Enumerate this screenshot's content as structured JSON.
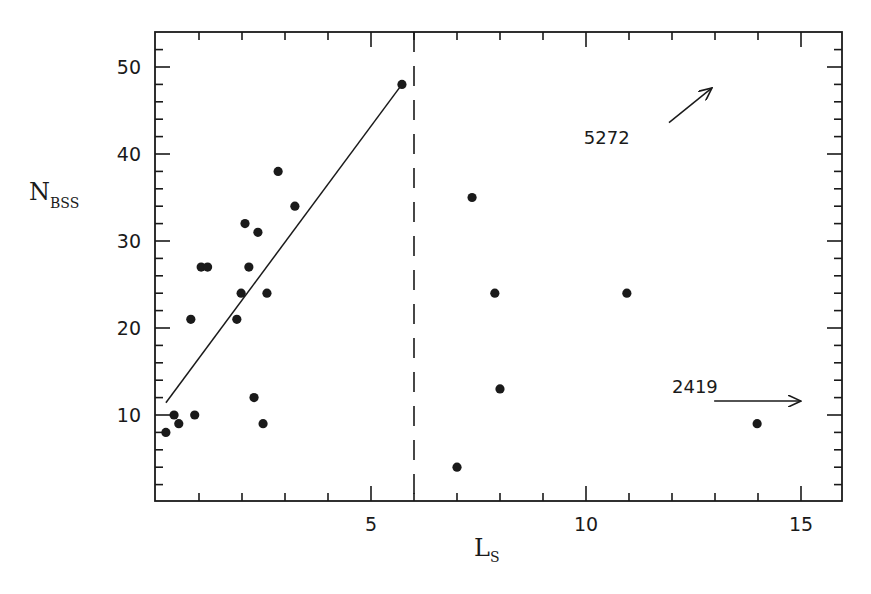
{
  "chart_data": {
    "type": "scatter",
    "title": "",
    "xlabel": "L",
    "xlabel_subscript": "S",
    "ylabel": "N",
    "ylabel_subscript": "BSS",
    "xlim": [
      0,
      16
    ],
    "ylim": [
      0,
      54
    ],
    "x_ticks_major": [
      5,
      10,
      15
    ],
    "x_tick_labels": [
      "5",
      "10",
      "15"
    ],
    "x_tick_minor_step": 1,
    "y_ticks_major": [
      10,
      20,
      30,
      40,
      50
    ],
    "y_tick_labels": [
      "10",
      "20",
      "30",
      "40",
      "50"
    ],
    "y_tick_minor_step": 2,
    "grid": false,
    "legend": null,
    "colors": {
      "ink": "#1a1a1a",
      "background": "#ffffff"
    },
    "series": [
      {
        "name": "clusters",
        "marker": "filled-circle",
        "points": [
          {
            "x": 0.23,
            "y": 8
          },
          {
            "x": 0.42,
            "y": 10
          },
          {
            "x": 0.53,
            "y": 9
          },
          {
            "x": 0.9,
            "y": 10
          },
          {
            "x": 0.81,
            "y": 21
          },
          {
            "x": 1.05,
            "y": 27
          },
          {
            "x": 1.2,
            "y": 27
          },
          {
            "x": 1.88,
            "y": 21
          },
          {
            "x": 1.98,
            "y": 24
          },
          {
            "x": 2.07,
            "y": 32
          },
          {
            "x": 2.16,
            "y": 27
          },
          {
            "x": 2.28,
            "y": 12
          },
          {
            "x": 2.37,
            "y": 31
          },
          {
            "x": 2.49,
            "y": 9
          },
          {
            "x": 2.58,
            "y": 24
          },
          {
            "x": 2.84,
            "y": 38
          },
          {
            "x": 3.23,
            "y": 34
          },
          {
            "x": 5.72,
            "y": 48
          },
          {
            "x": 7.0,
            "y": 4
          },
          {
            "x": 7.35,
            "y": 35
          },
          {
            "x": 7.88,
            "y": 24
          },
          {
            "x": 8.0,
            "y": 13
          },
          {
            "x": 10.95,
            "y": 24
          },
          {
            "x": 13.98,
            "y": 9
          }
        ]
      }
    ],
    "fit_line": {
      "x1": 0.23,
      "y1": 11.4,
      "x2": 5.72,
      "y2": 48
    },
    "vertical_dashed_line": {
      "x": 6
    },
    "annotations": [
      {
        "text": "5272",
        "text_x": 9.95,
        "text_y": 41.2,
        "arrow": {
          "x1": 11.93,
          "y1": 43.6,
          "x2": 12.93,
          "y2": 47.6
        }
      },
      {
        "text": "2419",
        "text_x": 12.0,
        "text_y": 12.5,
        "arrow": {
          "x1": 12.98,
          "y1": 11.6,
          "x2": 15.0,
          "y2": 11.6
        }
      }
    ]
  }
}
